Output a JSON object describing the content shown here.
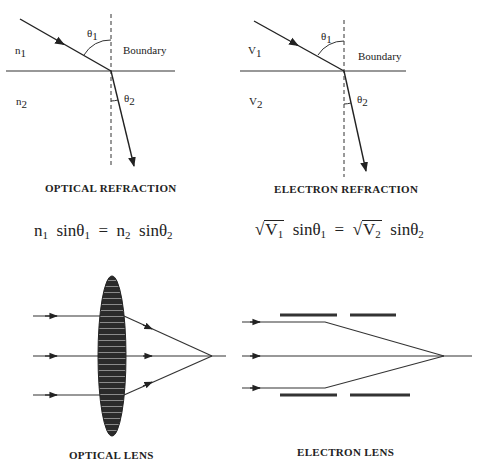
{
  "panels": {
    "optical_refraction": {
      "caption": "OPTICAL REFRACTION",
      "medium_1": "n",
      "medium_1_sub": "1",
      "medium_2": "n",
      "medium_2_sub": "2",
      "angle_1": "θ",
      "angle_1_sub": "1",
      "angle_2": "θ",
      "angle_2_sub": "2",
      "boundary_label": "Boundary"
    },
    "electron_refraction": {
      "caption": "ELECTRON REFRACTION",
      "medium_1": "V",
      "medium_1_sub": "1",
      "medium_2": "V",
      "medium_2_sub": "2",
      "angle_1": "θ",
      "angle_1_sub": "1",
      "angle_2": "θ",
      "angle_2_sub": "2",
      "boundary_label": "Boundary"
    },
    "optical_lens": {
      "caption": "OPTICAL LENS"
    },
    "electron_lens": {
      "caption": "ELECTRON LENS"
    }
  },
  "equations": {
    "optical": {
      "lhs_var": "n",
      "lhs_sub": "1",
      "lhs_fn": "sinθ",
      "lhs_fn_sub": "1",
      "eq": "=",
      "rhs_var": "n",
      "rhs_sub": "2",
      "rhs_fn": "sinθ",
      "rhs_fn_sub": "2"
    },
    "electron": {
      "radical": "√",
      "lhs_var": "V",
      "lhs_sub": "1",
      "lhs_fn": "sinθ",
      "lhs_fn_sub": "1",
      "eq": "=",
      "rhs_var": "V",
      "rhs_sub": "2",
      "rhs_fn": "sinθ",
      "rhs_fn_sub": "2"
    }
  }
}
